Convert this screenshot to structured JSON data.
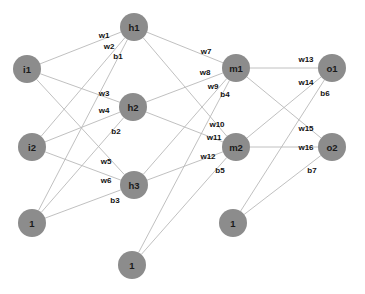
{
  "diagram": {
    "canvas": {
      "width": 365,
      "height": 294,
      "background": "#ffffff"
    },
    "style": {
      "node_fill": "#8c8c8c",
      "node_radius": 14,
      "edge_color": "#b9b9b9",
      "node_text_color": "#1a1a1a",
      "edge_text_color": "#111111"
    },
    "nodes": [
      {
        "id": "i1",
        "label": "i1",
        "x": 27,
        "y": 69,
        "r": 14,
        "layer": "input"
      },
      {
        "id": "i2",
        "label": "i2",
        "x": 32,
        "y": 147,
        "r": 14,
        "layer": "input"
      },
      {
        "id": "b_in",
        "label": "1",
        "x": 32,
        "y": 223,
        "r": 14,
        "layer": "bias-input"
      },
      {
        "id": "h1",
        "label": "h1",
        "x": 134,
        "y": 27,
        "r": 14,
        "layer": "hidden1"
      },
      {
        "id": "h2",
        "label": "h2",
        "x": 133,
        "y": 107,
        "r": 14,
        "layer": "hidden1"
      },
      {
        "id": "h3",
        "label": "h3",
        "x": 134,
        "y": 185,
        "r": 14,
        "layer": "hidden1"
      },
      {
        "id": "b_h",
        "label": "1",
        "x": 132,
        "y": 265,
        "r": 14,
        "layer": "bias-hidden1"
      },
      {
        "id": "m1",
        "label": "m1",
        "x": 236,
        "y": 68,
        "r": 14,
        "layer": "hidden2"
      },
      {
        "id": "m2",
        "label": "m2",
        "x": 236,
        "y": 147,
        "r": 14,
        "layer": "hidden2"
      },
      {
        "id": "b_m",
        "label": "1",
        "x": 233,
        "y": 223,
        "r": 14,
        "layer": "bias-hidden2"
      },
      {
        "id": "o1",
        "label": "o1",
        "x": 332,
        "y": 68,
        "r": 14,
        "layer": "output"
      },
      {
        "id": "o2",
        "label": "o2",
        "x": 332,
        "y": 147,
        "r": 14,
        "layer": "output"
      }
    ],
    "edges": [
      {
        "from": "i1",
        "to": "h1"
      },
      {
        "from": "i1",
        "to": "h2"
      },
      {
        "from": "i1",
        "to": "h3"
      },
      {
        "from": "i2",
        "to": "h1"
      },
      {
        "from": "i2",
        "to": "h2"
      },
      {
        "from": "i2",
        "to": "h3"
      },
      {
        "from": "b_in",
        "to": "h1"
      },
      {
        "from": "b_in",
        "to": "h2"
      },
      {
        "from": "b_in",
        "to": "h3"
      },
      {
        "from": "h1",
        "to": "m1"
      },
      {
        "from": "h1",
        "to": "m2"
      },
      {
        "from": "h2",
        "to": "m1"
      },
      {
        "from": "h2",
        "to": "m2"
      },
      {
        "from": "h3",
        "to": "m1"
      },
      {
        "from": "h3",
        "to": "m2"
      },
      {
        "from": "b_h",
        "to": "m1"
      },
      {
        "from": "b_h",
        "to": "m2"
      },
      {
        "from": "m1",
        "to": "o1"
      },
      {
        "from": "m1",
        "to": "o2"
      },
      {
        "from": "m2",
        "to": "o1"
      },
      {
        "from": "m2",
        "to": "o2"
      },
      {
        "from": "b_m",
        "to": "o1"
      },
      {
        "from": "b_m",
        "to": "o2"
      }
    ],
    "edge_labels": [
      {
        "id": "w1",
        "text": "w1",
        "x": 104,
        "y": 35
      },
      {
        "id": "w2",
        "text": "w2",
        "x": 109,
        "y": 46
      },
      {
        "id": "b1",
        "text": "b1",
        "x": 118,
        "y": 56
      },
      {
        "id": "w3",
        "text": "w3",
        "x": 104,
        "y": 93
      },
      {
        "id": "w4",
        "text": "w4",
        "x": 104,
        "y": 110
      },
      {
        "id": "b2",
        "text": "b2",
        "x": 116,
        "y": 131
      },
      {
        "id": "w5",
        "text": "w5",
        "x": 106,
        "y": 161
      },
      {
        "id": "w6",
        "text": "w6",
        "x": 106,
        "y": 180
      },
      {
        "id": "b3",
        "text": "b3",
        "x": 115,
        "y": 200
      },
      {
        "id": "w7",
        "text": "w7",
        "x": 206,
        "y": 51
      },
      {
        "id": "w8",
        "text": "w8",
        "x": 205,
        "y": 72
      },
      {
        "id": "w9",
        "text": "w9",
        "x": 213,
        "y": 86
      },
      {
        "id": "b4",
        "text": "b4",
        "x": 225,
        "y": 94
      },
      {
        "id": "w10",
        "text": "w10",
        "x": 217,
        "y": 124
      },
      {
        "id": "w11",
        "text": "w11",
        "x": 214,
        "y": 137
      },
      {
        "id": "w12",
        "text": "w12",
        "x": 208,
        "y": 156
      },
      {
        "id": "b5",
        "text": "b5",
        "x": 220,
        "y": 170
      },
      {
        "id": "w13",
        "text": "w13",
        "x": 306,
        "y": 59
      },
      {
        "id": "w14",
        "text": "w14",
        "x": 306,
        "y": 82
      },
      {
        "id": "b6",
        "text": "b6",
        "x": 325,
        "y": 93
      },
      {
        "id": "w15",
        "text": "w15",
        "x": 306,
        "y": 128
      },
      {
        "id": "w16",
        "text": "w16",
        "x": 306,
        "y": 147
      },
      {
        "id": "b7",
        "text": "b7",
        "x": 312,
        "y": 170
      }
    ]
  }
}
